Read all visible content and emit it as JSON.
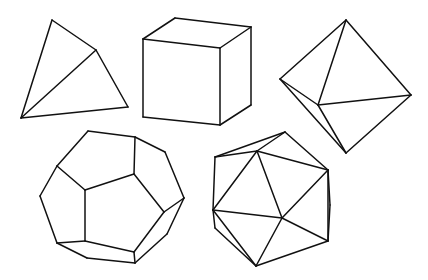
{
  "stroke_color": "#111111",
  "background": "#ffffff",
  "solids": [
    {
      "name": "tetrahedron",
      "vertices": {
        "top": [
          52,
          20
        ],
        "mid": [
          96,
          50
        ],
        "br": [
          128,
          107
        ],
        "bl": [
          21,
          118
        ]
      },
      "edges": [
        [
          "top",
          "bl"
        ],
        [
          "top",
          "mid"
        ],
        [
          "mid",
          "br"
        ],
        [
          "br",
          "bl"
        ],
        [
          "bl",
          "mid"
        ]
      ]
    },
    {
      "name": "cube",
      "vertices": {
        "ftl": [
          143,
          39
        ],
        "ftr": [
          220,
          48
        ],
        "fbr": [
          220,
          125
        ],
        "fbl": [
          143,
          117
        ],
        "btl": [
          175,
          18
        ],
        "btr": [
          251,
          27
        ],
        "bbr": [
          251,
          105
        ]
      },
      "edges": [
        [
          "ftl",
          "ftr"
        ],
        [
          "ftr",
          "fbr"
        ],
        [
          "fbr",
          "fbl"
        ],
        [
          "fbl",
          "ftl"
        ],
        [
          "ftl",
          "btl"
        ],
        [
          "btl",
          "btr"
        ],
        [
          "btr",
          "ftr"
        ],
        [
          "btr",
          "bbr"
        ],
        [
          "bbr",
          "fbr"
        ]
      ]
    },
    {
      "name": "octahedron",
      "vertices": {
        "top": [
          346,
          20
        ],
        "left": [
          280,
          79
        ],
        "right": [
          411,
          95
        ],
        "bottom": [
          346,
          153
        ],
        "front": [
          318,
          105
        ]
      },
      "edges": [
        [
          "top",
          "left"
        ],
        [
          "top",
          "right"
        ],
        [
          "top",
          "front"
        ],
        [
          "left",
          "front"
        ],
        [
          "front",
          "right"
        ],
        [
          "left",
          "bottom"
        ],
        [
          "front",
          "bottom"
        ],
        [
          "right",
          "bottom"
        ]
      ]
    },
    {
      "name": "dodecahedron",
      "vertices": {
        "o1": [
          88,
          131
        ],
        "o2": [
          135,
          137
        ],
        "o3": [
          165,
          152
        ],
        "o4": [
          184,
          198
        ],
        "o5": [
          167,
          234
        ],
        "o6": [
          135,
          263
        ],
        "o7": [
          87,
          258
        ],
        "o8": [
          57,
          243
        ],
        "o9": [
          40,
          196
        ],
        "o10": [
          57,
          166
        ],
        "i1": [
          85,
          190
        ],
        "i2": [
          134,
          174
        ],
        "i3": [
          164,
          212
        ],
        "i4": [
          134,
          252
        ],
        "i5": [
          85,
          241
        ]
      },
      "edges": [
        [
          "o1",
          "o2"
        ],
        [
          "o2",
          "o3"
        ],
        [
          "o3",
          "o4"
        ],
        [
          "o4",
          "o5"
        ],
        [
          "o5",
          "o6"
        ],
        [
          "o6",
          "o7"
        ],
        [
          "o7",
          "o8"
        ],
        [
          "o8",
          "o9"
        ],
        [
          "o9",
          "o10"
        ],
        [
          "o10",
          "o1"
        ],
        [
          "i1",
          "i2"
        ],
        [
          "i2",
          "i3"
        ],
        [
          "i3",
          "i4"
        ],
        [
          "i4",
          "i5"
        ],
        [
          "i5",
          "i1"
        ],
        [
          "o10",
          "i1"
        ],
        [
          "o2",
          "i2"
        ],
        [
          "o4",
          "i3"
        ],
        [
          "i4",
          "o6"
        ],
        [
          "o8",
          "i5"
        ]
      ]
    },
    {
      "name": "icosahedron",
      "vertices": {
        "top": [
          285,
          132
        ],
        "ul": [
          215,
          157
        ],
        "um": [
          257,
          151
        ],
        "right": [
          328,
          170
        ],
        "rmid": [
          330,
          205
        ],
        "left": [
          213,
          210
        ],
        "center": [
          282,
          218
        ],
        "lr": [
          328,
          241
        ],
        "bottom": [
          256,
          266
        ],
        "ll": [
          215,
          228
        ]
      },
      "edges": [
        [
          "ul",
          "top"
        ],
        [
          "top",
          "right"
        ],
        [
          "ul",
          "um"
        ],
        [
          "um",
          "right"
        ],
        [
          "um",
          "top"
        ],
        [
          "ul",
          "left"
        ],
        [
          "um",
          "left"
        ],
        [
          "um",
          "center"
        ],
        [
          "right",
          "center"
        ],
        [
          "left",
          "center"
        ],
        [
          "center",
          "lr"
        ],
        [
          "center",
          "bottom"
        ],
        [
          "right",
          "rmid"
        ],
        [
          "rmid",
          "lr"
        ],
        [
          "right",
          "lr"
        ],
        [
          "lr",
          "bottom"
        ],
        [
          "left",
          "ll"
        ],
        [
          "ll",
          "bottom"
        ],
        [
          "left",
          "bottom"
        ]
      ]
    }
  ]
}
